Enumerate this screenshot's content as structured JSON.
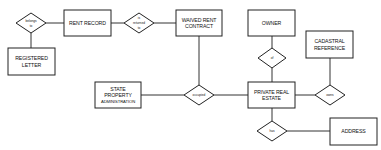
{
  "diagram": {
    "type": "entity-relationship",
    "entities": {
      "rent_record": [
        "RENT RECORD"
      ],
      "waived_rent_contract": [
        "WAIVED RENT",
        "CONTRACT"
      ],
      "registered_letter": [
        "REGISTERED",
        "LETTER"
      ],
      "owner": [
        "OWNER"
      ],
      "cadastral_reference": [
        "CADASTRAL",
        "REFERENCE"
      ],
      "state_property_administration": [
        "STATE",
        "PROPERTY",
        "ADMINISTRATION"
      ],
      "private_real_estate": [
        "PRIVATE REAL",
        "ESTATE"
      ],
      "address": [
        "ADDRESS"
      ]
    },
    "relationships": {
      "belongs_to": [
        "belongs",
        "to"
      ],
      "is_returned": [
        "is",
        "returned",
        "to"
      ],
      "occupied_by": [
        "occupied"
      ],
      "of": [
        "of"
      ],
      "owns": [
        "owns"
      ],
      "has": [
        "has"
      ]
    },
    "connections": [
      [
        "belongs_to",
        "rent_record"
      ],
      [
        "belongs_to",
        "registered_letter"
      ],
      [
        "rent_record",
        "is_returned"
      ],
      [
        "is_returned",
        "waived_rent_contract"
      ],
      [
        "waived_rent_contract",
        "occupied_by"
      ],
      [
        "state_property_administration",
        "occupied_by"
      ],
      [
        "occupied_by",
        "private_real_estate"
      ],
      [
        "owner",
        "of"
      ],
      [
        "of",
        "private_real_estate"
      ],
      [
        "private_real_estate",
        "owns"
      ],
      [
        "owns",
        "cadastral_reference"
      ],
      [
        "private_real_estate",
        "has"
      ],
      [
        "has",
        "address"
      ]
    ]
  }
}
